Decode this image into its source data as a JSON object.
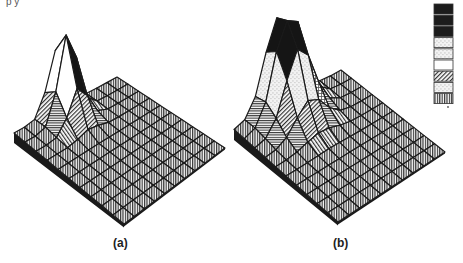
{
  "header_fragment": {
    "text": "p          y"
  },
  "captions": {
    "a": "(a)",
    "b": "(b)"
  },
  "colors": {
    "ink": "#1a1a1a",
    "paper": "#ffffff",
    "hatch": "#3a3a3a"
  },
  "chart_data": [
    {
      "type": "surface3d",
      "title": "(a)",
      "description": "Isometric 3D mesh surface on a 10x10 grid with a single sharp peak at the back-left corner, decaying quickly to a flat sloping plane",
      "grid_size": [
        10,
        10
      ],
      "peak": {
        "position": "left corner",
        "relative_height": 1.0,
        "sharpness": "high"
      },
      "fill_patterns_by_height": [
        "vertical-hatch",
        "horizontal-hatch",
        "diagonal-hatch",
        "speckle",
        "white",
        "black"
      ],
      "corners_px": {
        "left": [
          14,
          133
        ],
        "front": [
          124,
          224
        ],
        "right": [
          225,
          148
        ],
        "back": [
          117,
          77
        ],
        "peak_tip": [
          45,
          46
        ]
      }
    },
    {
      "type": "surface3d",
      "title": "(b)",
      "description": "Isometric 3D mesh surface on a 10x10 grid with a broader, taller peak at the back-left corner, with a plateau-like dark top",
      "grid_size": [
        10,
        10
      ],
      "peak": {
        "position": "left corner",
        "relative_height": 1.0,
        "sharpness": "medium"
      },
      "fill_patterns_by_height": [
        "vertical-hatch",
        "horizontal-hatch",
        "diagonal-hatch",
        "grid",
        "speckle",
        "white",
        "black"
      ],
      "corners_px": {
        "left": [
          234,
          130
        ],
        "front": [
          338,
          222
        ],
        "right": [
          445,
          152
        ],
        "back": [
          341,
          70
        ],
        "peak_tip": [
          284,
          25
        ]
      }
    }
  ],
  "legend": {
    "position": "top-right",
    "swatches": [
      "black",
      "black",
      "black",
      "white-speckle",
      "white-speckle",
      "white",
      "diagonal-hatch",
      "light-speckle",
      "vertical-hatch"
    ]
  }
}
